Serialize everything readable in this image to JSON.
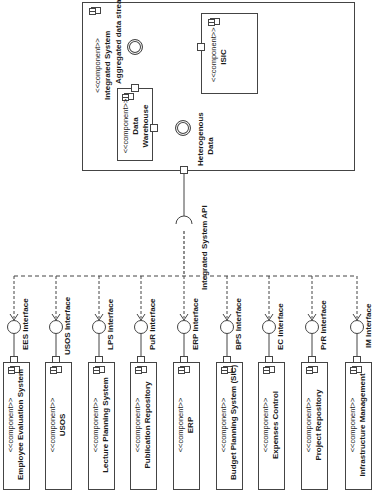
{
  "diagram": {
    "type": "UML component diagram (rotated 90°)",
    "integrated_system": {
      "stereotype": "<<component>>",
      "name": "Integrated System",
      "internal": {
        "data_warehouse": {
          "stereotype": "<<component>>",
          "name_line1": "Data",
          "name_line2": "Warehouse"
        },
        "isic": {
          "stereotype": "<<component>>",
          "name": "ISIC"
        },
        "aggregated_interface": "Aggregated data stream",
        "heterogeneous_interface_line1": "Heterogenous",
        "heterogeneous_interface_line2": "Data"
      }
    },
    "api_label": "Integrated System API",
    "components": [
      {
        "stereotype": "<<component>>",
        "name": "Employee Evaluation System",
        "interface": "EES Interface"
      },
      {
        "stereotype": "<<component>>",
        "name": "USOS",
        "interface": "USOS Interface"
      },
      {
        "stereotype": "<<component>>",
        "name": "Lecture Planning System",
        "interface": "LPS Interface"
      },
      {
        "stereotype": "<<component>>",
        "name": "Publication Repository",
        "interface": "PuR Interface"
      },
      {
        "stereotype": "<<component>>",
        "name": "ERP",
        "interface": "ERP Interface"
      },
      {
        "stereotype": "<<component>>",
        "name": "Budget Planning System (SIC)",
        "interface": "BPS Interface"
      },
      {
        "stereotype": "<<component>>",
        "name": "Expenses Control",
        "interface": "EC Interface"
      },
      {
        "stereotype": "<<component>>",
        "name": "Project Repository",
        "interface": "PrR Interface"
      },
      {
        "stereotype": "<<component>>",
        "name": "Infrastructure Management",
        "interface": "IM Interface"
      }
    ]
  }
}
